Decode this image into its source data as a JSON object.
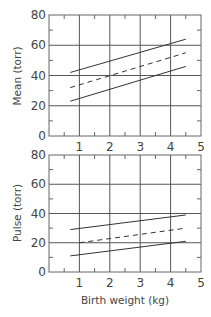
{
  "chart_data": [
    {
      "type": "line",
      "title": "",
      "xlabel": "",
      "ylabel": "Mean (torr)",
      "xlim": [
        0,
        5
      ],
      "ylim": [
        0,
        80
      ],
      "x_ticks": [
        "1",
        "2",
        "3",
        "4",
        "5"
      ],
      "y_ticks": [
        "0",
        "20",
        "40",
        "60",
        "80"
      ],
      "grid": true,
      "series": [
        {
          "name": "upper",
          "style": "solid",
          "x": [
            0.7,
            4.5
          ],
          "y": [
            42,
            64
          ]
        },
        {
          "name": "mean",
          "style": "dashed",
          "x": [
            0.7,
            4.5
          ],
          "y": [
            32,
            55
          ]
        },
        {
          "name": "lower",
          "style": "solid",
          "x": [
            0.7,
            4.5
          ],
          "y": [
            23,
            46
          ]
        }
      ]
    },
    {
      "type": "line",
      "title": "",
      "xlabel": "Birth weight (kg)",
      "ylabel": "Pulse (torr)",
      "xlim": [
        0,
        5
      ],
      "ylim": [
        0,
        80
      ],
      "x_ticks": [
        "1",
        "2",
        "3",
        "4",
        "5"
      ],
      "y_ticks": [
        "0",
        "20",
        "40",
        "60",
        "80"
      ],
      "grid": true,
      "series": [
        {
          "name": "upper",
          "style": "solid",
          "x": [
            0.7,
            4.5
          ],
          "y": [
            29,
            39
          ]
        },
        {
          "name": "mean",
          "style": "dashed",
          "x": [
            1.0,
            4.5
          ],
          "y": [
            20,
            30
          ]
        },
        {
          "name": "lower",
          "style": "solid",
          "x": [
            0.7,
            4.5
          ],
          "y": [
            11,
            21
          ]
        }
      ]
    }
  ],
  "labels": {
    "top_ylabel": "Mean (torr)",
    "bottom_ylabel": "Pulse (torr)",
    "xlabel": "Birth weight (kg)",
    "x_ticks": [
      "1",
      "2",
      "3",
      "4",
      "5"
    ],
    "y_ticks": [
      "0",
      "20",
      "40",
      "60",
      "80"
    ]
  }
}
